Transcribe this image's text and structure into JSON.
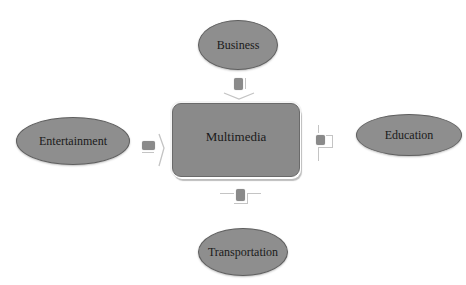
{
  "diagram": {
    "center": {
      "label": "Multimedia"
    },
    "nodes": {
      "top": {
        "label": "Business"
      },
      "left": {
        "label": "Entertainment"
      },
      "right": {
        "label": "Education"
      },
      "bottom": {
        "label": "Transportation"
      }
    },
    "colors": {
      "node_fill": "#8e8e8e",
      "node_border": "#5f5f5f",
      "center_fill": "#8a8a8a",
      "connector_line": "#c4c4c4",
      "background": "#ffffff"
    }
  }
}
